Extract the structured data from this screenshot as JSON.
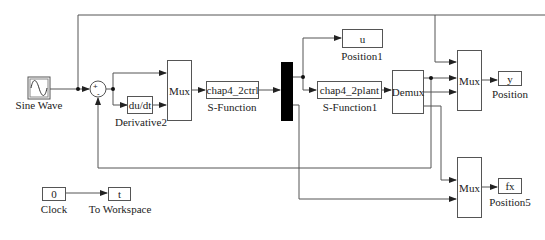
{
  "diagram": {
    "type": "simulink-block-diagram",
    "blocks": {
      "sine_wave": {
        "label": "Sine Wave"
      },
      "sum": {
        "signs": "+-"
      },
      "derivative": {
        "text": "du/dt",
        "label": "Derivative2"
      },
      "mux1": {
        "text": "Mux"
      },
      "ctrl": {
        "text": "chap4_2ctrl",
        "label": "S-Function"
      },
      "position1": {
        "text": "u",
        "label": "Position1"
      },
      "plant": {
        "text": "chap4_2plant",
        "label": "S-Function1"
      },
      "demux": {
        "text": "Demux"
      },
      "mux2": {
        "text": "Mux"
      },
      "position": {
        "text": "y",
        "label": "Position"
      },
      "mux3": {
        "text": "Mux"
      },
      "position5": {
        "text": "fx",
        "label": "Position5"
      },
      "clock": {
        "text": "0",
        "label": "Clock"
      },
      "to_workspace": {
        "text": "t",
        "label": "To Workspace"
      }
    },
    "colors": {
      "line": "#555555",
      "bus": "#000000",
      "background": "#ffffff"
    }
  }
}
